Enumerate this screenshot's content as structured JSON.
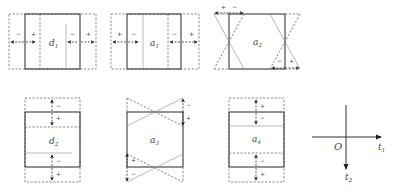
{
  "figure": {
    "panels": [
      {
        "id": "d1",
        "label": "d",
        "subscript": "1",
        "mode": "horizontal-strain",
        "signs": [
          "−",
          "+",
          "−",
          "+"
        ]
      },
      {
        "id": "a1",
        "label": "a",
        "subscript": "1",
        "mode": "horizontal-strain",
        "signs": [
          "+",
          "−",
          "−",
          "+"
        ]
      },
      {
        "id": "a2",
        "label": "a",
        "subscript": "2",
        "mode": "horizontal-shear",
        "signs": [
          "+",
          "−",
          "−",
          "+"
        ]
      },
      {
        "id": "d2",
        "label": "d",
        "subscript": "2",
        "mode": "vertical-strain",
        "signs": [
          "−",
          "+",
          "−",
          "+"
        ]
      },
      {
        "id": "a3",
        "label": "a",
        "subscript": "3",
        "mode": "vertical-shear",
        "signs": [
          "−",
          "+",
          "+",
          "−"
        ]
      },
      {
        "id": "a4",
        "label": "a",
        "subscript": "4",
        "mode": "vertical-strain",
        "signs": [
          "+",
          "−",
          "−",
          "+"
        ]
      }
    ],
    "axes": {
      "origin_label": "O",
      "x_label": "t",
      "x_sub": "1",
      "y_label": "t",
      "y_sub": "2"
    }
  }
}
